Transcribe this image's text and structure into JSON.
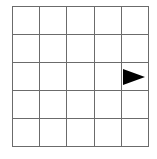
{
  "grid": {
    "rows": 5,
    "cols": 5,
    "line_color": "#6b6b6b",
    "background": "#ffffff"
  },
  "agent": {
    "row": 2,
    "col": 4,
    "direction": "right",
    "shape": "triangle",
    "color": "#000000"
  }
}
